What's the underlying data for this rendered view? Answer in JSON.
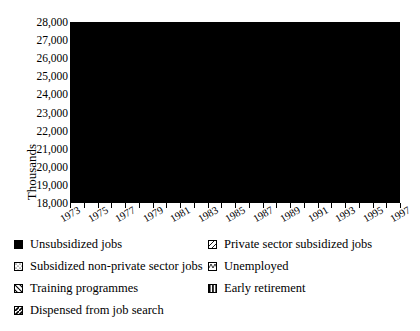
{
  "axis": {
    "ylabel": "Thousands",
    "yticks": [
      "28,000",
      "27,000",
      "26,000",
      "25,000",
      "24,000",
      "23,000",
      "22,000",
      "21,000",
      "20,000",
      "19,000",
      "18,000"
    ],
    "xlabels": [
      "1973",
      "1975",
      "1977",
      "1979",
      "1981",
      "1983",
      "1985",
      "1987",
      "1989",
      "1991",
      "1993",
      "1995",
      "1997"
    ]
  },
  "legend": {
    "items": [
      {
        "label": "Unsubsidized jobs",
        "pattern": "solid-black",
        "col": 0,
        "row": 0
      },
      {
        "label": "Private sector subsidized jobs",
        "pattern": "diagonal-hatch",
        "col": 1,
        "row": 0
      },
      {
        "label": "Subsidized non-private sector jobs",
        "pattern": "dotted",
        "col": 0,
        "row": 1
      },
      {
        "label": "Unemployed",
        "pattern": "white-empty",
        "col": 1,
        "row": 1
      },
      {
        "label": "Training programmes",
        "pattern": "diagonal-thick",
        "col": 0,
        "row": 2
      },
      {
        "label": "Early retirement",
        "pattern": "vertical-stripes",
        "col": 1,
        "row": 2
      },
      {
        "label": "Dispensed from job search",
        "pattern": "diagonal-dark",
        "col": 0,
        "row": 3
      }
    ]
  },
  "chart_data": {
    "type": "area",
    "stacked": true,
    "title": "",
    "xlabel": "",
    "ylabel": "Thousands",
    "ylim": [
      18000,
      28000
    ],
    "ytick_step": 1000,
    "grid": "horizontal",
    "legend_position": "below",
    "x": [
      1973,
      1974,
      1975,
      1976,
      1977,
      1978,
      1979,
      1980,
      1981,
      1982,
      1983,
      1984,
      1985,
      1986,
      1987,
      1988,
      1989,
      1990,
      1991,
      1992,
      1993,
      1994,
      1995,
      1996,
      1997
    ],
    "series": [
      {
        "name": "Unsubsidized jobs",
        "pattern": "solid-black",
        "values": [
          21100,
          21150,
          21000,
          20950,
          21000,
          21050,
          21150,
          21200,
          21000,
          20800,
          20700,
          20750,
          20850,
          20950,
          21050,
          21250,
          21500,
          21600,
          21500,
          21250,
          20950,
          20900,
          21000,
          21050,
          21150
        ]
      },
      {
        "name": "Unemployed",
        "pattern": "white-empty",
        "values": [
          250,
          300,
          520,
          600,
          620,
          640,
          620,
          600,
          780,
          1000,
          1150,
          1200,
          1180,
          1150,
          1080,
          950,
          800,
          750,
          850,
          1100,
          1400,
          1450,
          1380,
          1400,
          1320
        ]
      },
      {
        "name": "Subsidized non-private sector jobs",
        "pattern": "dotted",
        "values": [
          120,
          130,
          150,
          170,
          190,
          200,
          210,
          220,
          230,
          250,
          260,
          280,
          290,
          300,
          310,
          320,
          330,
          340,
          350,
          360,
          380,
          390,
          400,
          410,
          420
        ]
      },
      {
        "name": "Private sector subsidized jobs",
        "pattern": "diagonal-hatch",
        "values": [
          60,
          70,
          80,
          100,
          120,
          140,
          160,
          180,
          200,
          230,
          260,
          290,
          320,
          350,
          380,
          420,
          460,
          500,
          540,
          580,
          620,
          660,
          700,
          740,
          780
        ]
      },
      {
        "name": "Training programmes",
        "pattern": "diagonal-thick",
        "values": [
          130,
          150,
          180,
          220,
          260,
          300,
          340,
          380,
          430,
          480,
          530,
          580,
          620,
          660,
          700,
          740,
          780,
          820,
          860,
          900,
          940,
          980,
          1020,
          1060,
          1100
        ]
      },
      {
        "name": "Early retirement",
        "pattern": "vertical-stripes",
        "values": [
          60,
          90,
          140,
          200,
          280,
          360,
          440,
          520,
          600,
          700,
          800,
          900,
          980,
          1050,
          1120,
          1180,
          1220,
          1250,
          1260,
          1250,
          1230,
          1200,
          1180,
          1160,
          1140
        ]
      },
      {
        "name": "Dispensed from job search",
        "pattern": "diagonal-dark",
        "values": [
          40,
          50,
          60,
          80,
          100,
          120,
          150,
          180,
          220,
          270,
          320,
          380,
          430,
          480,
          530,
          580,
          630,
          680,
          720,
          760,
          800,
          840,
          880,
          920,
          960
        ]
      }
    ]
  }
}
